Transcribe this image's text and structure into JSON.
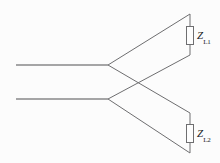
{
  "diagram": {
    "type": "electrical-schematic",
    "canvas": {
      "width": 220,
      "height": 163,
      "background": "#fcfcfc"
    },
    "colors": {
      "wire": "#6e6e70",
      "label_text": "#1b1b1d",
      "component_fill": "#fdfdfd"
    },
    "terminals": [
      {
        "name": "input-terminal-upper",
        "x": 16,
        "y": 65
      },
      {
        "name": "input-terminal-lower",
        "x": 16,
        "y": 99
      }
    ],
    "nodes": [
      {
        "name": "junction-upper",
        "x": 108,
        "y": 65
      },
      {
        "name": "junction-lower",
        "x": 108,
        "y": 99
      },
      {
        "name": "crossover-point",
        "x": 145,
        "y": 82
      }
    ],
    "wires": [
      {
        "name": "lead-upper-horizontal",
        "path": "M16,65 L108,65"
      },
      {
        "name": "lead-lower-horizontal",
        "path": "M16,99 L108,99"
      },
      {
        "name": "branch-upper-to-top",
        "path": "M108,65 L190,14"
      },
      {
        "name": "branch-upper-to-bottom-cross",
        "path": "M108,65 L190,113"
      },
      {
        "name": "branch-lower-to-top-cross",
        "path": "M108,99 L190,55"
      },
      {
        "name": "branch-lower-to-bottom",
        "path": "M108,99 L190,153"
      },
      {
        "name": "vertical-rail-upper",
        "path": "M190,14 L190,55"
      },
      {
        "name": "vertical-rail-lower",
        "path": "M190,113 L190,153"
      }
    ],
    "components": [
      {
        "name": "impedance-zl1",
        "kind": "impedance-box",
        "x": 186.5,
        "y": 26.5,
        "width": 7,
        "height": 18,
        "label": "Z",
        "subscript": "L1",
        "label_x": 197,
        "label_y": 30
      },
      {
        "name": "impedance-zl2",
        "kind": "impedance-box",
        "x": 186.5,
        "y": 124.5,
        "width": 7,
        "height": 18,
        "label": "Z",
        "subscript": "L2",
        "label_x": 197,
        "label_y": 128
      }
    ]
  }
}
